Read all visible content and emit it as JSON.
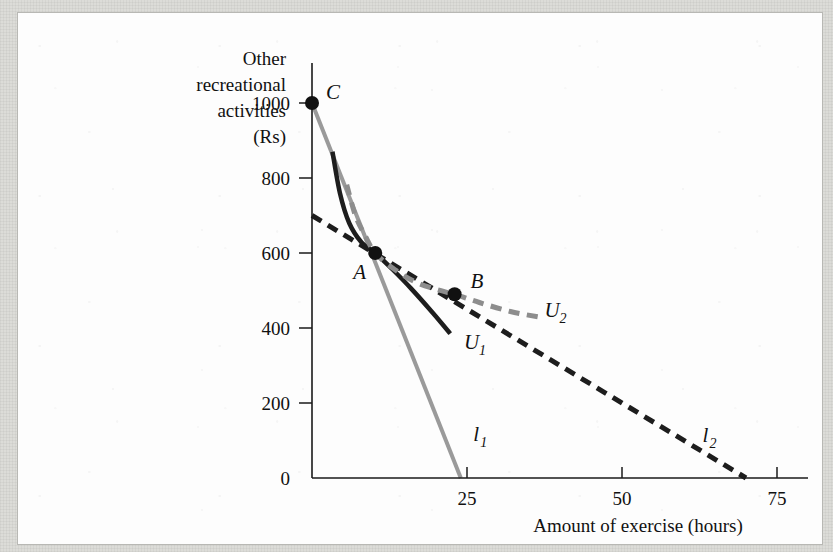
{
  "figure": {
    "background_color": "#dcdcd8",
    "panel_color": "#fdfdfd",
    "panel_border_color": "#b8b8b4"
  },
  "chart_data": {
    "type": "line",
    "title": "",
    "xlabel": "Amount of exercise (hours)",
    "ylabel": "Other recreational activities (Rs)",
    "ylabel_lines": [
      "Other",
      "recreational",
      "activities",
      "(Rs)"
    ],
    "xlim": [
      0,
      80
    ],
    "ylim": [
      0,
      1080
    ],
    "xticks": [
      25,
      50,
      75
    ],
    "xtick_labels": [
      "25",
      "50",
      "75"
    ],
    "yticks": [
      0,
      200,
      400,
      600,
      800,
      1000
    ],
    "ytick_labels": [
      "0",
      "200",
      "400",
      "600",
      "800",
      "1000"
    ],
    "grid": false,
    "legend": "inline-curve-labels",
    "series": [
      {
        "name": "l_1",
        "label": "l",
        "label_sub": "1",
        "role": "budget-line-initial",
        "style": "solid",
        "color": "#9a9a9a",
        "linewidth": 4,
        "points": [
          [
            0,
            1000
          ],
          [
            24,
            0
          ]
        ]
      },
      {
        "name": "l_2",
        "label": "l",
        "label_sub": "2",
        "role": "budget-line-new",
        "style": "dashed",
        "color": "#1d1d1d",
        "linewidth": 5,
        "points": [
          [
            0,
            700
          ],
          [
            70,
            0
          ]
        ]
      },
      {
        "name": "U_1",
        "label": "U",
        "label_sub": "1",
        "role": "indifference-curve-initial",
        "style": "solid",
        "color": "#1d1d1d",
        "linewidth": 4.5,
        "points": [
          [
            3.3,
            870
          ],
          [
            4.5,
            760
          ],
          [
            6.0,
            680
          ],
          [
            8.0,
            628
          ],
          [
            10.2,
            600
          ],
          [
            13.0,
            556
          ],
          [
            16.0,
            505
          ],
          [
            19.5,
            440
          ],
          [
            22.3,
            385
          ]
        ]
      },
      {
        "name": "U_2",
        "label": "U",
        "label_sub": "2",
        "role": "indifference-curve-new",
        "style": "dashed",
        "color": "#8d8d8d",
        "linewidth": 5,
        "points": [
          [
            5.6,
            782
          ],
          [
            7.0,
            700
          ],
          [
            8.6,
            645
          ],
          [
            10.2,
            600
          ],
          [
            13.0,
            560
          ],
          [
            16.5,
            524
          ],
          [
            20.0,
            503
          ],
          [
            23.0,
            490
          ],
          [
            27.0,
            468
          ],
          [
            32.0,
            444
          ],
          [
            37.0,
            428
          ]
        ]
      }
    ],
    "points": [
      {
        "label": "C",
        "x": 0,
        "y": 1000,
        "label_dx": 14,
        "label_dy": -4
      },
      {
        "label": "A",
        "x": 10.2,
        "y": 600,
        "label_dx": -22,
        "label_dy": 26
      },
      {
        "label": "B",
        "x": 23.0,
        "y": 490,
        "label_dx": 16,
        "label_dy": -6
      }
    ],
    "curve_label_positions": [
      {
        "name": "l_1",
        "x": 26.0,
        "y": 100
      },
      {
        "name": "l_2",
        "x": 63.0,
        "y": 95
      },
      {
        "name": "U_1",
        "x": 24.5,
        "y": 345
      },
      {
        "name": "U_2",
        "x": 37.5,
        "y": 430
      }
    ]
  }
}
